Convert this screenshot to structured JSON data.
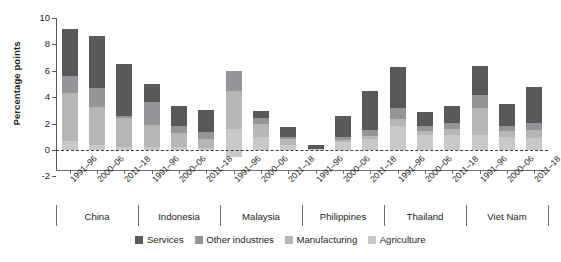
{
  "chart_data": {
    "type": "bar",
    "title": "",
    "subtitle": "",
    "xlabel": "",
    "ylabel": "Percentage points",
    "ylim": [
      -2,
      10
    ],
    "yticks": [
      -2,
      0,
      2,
      4,
      6,
      8,
      10
    ],
    "ytick_labels": [
      "-2",
      "0",
      "2",
      "4",
      "6",
      "8",
      "10"
    ],
    "grid": false,
    "stacked": true,
    "legend_position": "bottom",
    "zero_reference_line": true,
    "groups": [
      "China",
      "Indonesia",
      "Malaysia",
      "Philippines",
      "Thailand",
      "Viet Nam"
    ],
    "periods": [
      "1991–96",
      "2000–06",
      "2011–18"
    ],
    "categories": [
      "China 1991–96",
      "China 2000–06",
      "China 2011–18",
      "Indonesia 1991–96",
      "Indonesia 2000–06",
      "Indonesia 2011–18",
      "Malaysia 1991–96",
      "Malaysia 2000–06",
      "Malaysia 2011–18",
      "Philippines 1991–96",
      "Philippines 2000–06",
      "Philippines 2011–18",
      "Thailand 1991–96",
      "Thailand 2000–06",
      "Thailand 2011–18",
      "Viet Nam 1991–96",
      "Viet Nam 2000–06",
      "Viet Nam 2011–18"
    ],
    "series": [
      {
        "name": "Agriculture",
        "color": "#c9cac8",
        "values": [
          0.7,
          0.35,
          0.2,
          0.25,
          0.2,
          0.15,
          1.6,
          0.95,
          0.35,
          0.1,
          0.6,
          0.85,
          1.85,
          1.15,
          1.15,
          1.15,
          1.0,
          0.9
        ]
      },
      {
        "name": "Manufacturing",
        "color": "#b6b7b5",
        "values": [
          3.6,
          2.9,
          2.2,
          1.65,
          1.1,
          0.7,
          2.9,
          1.0,
          0.45,
          0.0,
          0.15,
          0.2,
          0.5,
          0.3,
          0.45,
          2.0,
          0.45,
          0.6
        ]
      },
      {
        "name": "Other industries",
        "color": "#939598",
        "values": [
          1.3,
          1.45,
          0.2,
          1.7,
          0.5,
          0.55,
          1.5,
          0.5,
          0.2,
          0.0,
          0.25,
          0.5,
          0.85,
          0.4,
          0.45,
          1.0,
          0.4,
          0.55
        ]
      },
      {
        "name": "Services",
        "color": "#58595b",
        "values": [
          3.6,
          3.95,
          3.95,
          1.4,
          1.5,
          1.65,
          0.0,
          0.5,
          0.75,
          0.25,
          1.55,
          2.9,
          3.1,
          1.05,
          1.3,
          2.2,
          1.6,
          2.7
        ]
      },
      {
        "name": "Agriculture (negative)",
        "color": "#c9cac8",
        "negative": true,
        "values": [
          0,
          0,
          0,
          0,
          0,
          0,
          -0.55,
          0,
          0,
          0,
          0,
          0,
          0,
          0,
          0,
          0,
          0,
          0
        ]
      }
    ],
    "totals": [
      9.2,
      8.65,
      6.55,
      5.0,
      3.3,
      3.05,
      5.9,
      2.85,
      1.75,
      0.35,
      2.5,
      4.65,
      6.3,
      2.9,
      3.35,
      6.35,
      3.45,
      4.75
    ]
  },
  "legend": {
    "items": [
      {
        "label": "Services",
        "color": "#58595b"
      },
      {
        "label": "Other industries",
        "color": "#939598"
      },
      {
        "label": "Manufacturing",
        "color": "#b6b7b5"
      },
      {
        "label": "Agriculture",
        "color": "#c9cac8"
      }
    ]
  }
}
